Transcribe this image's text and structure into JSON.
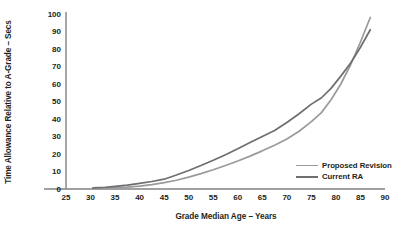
{
  "chart_data": {
    "type": "line",
    "title": "",
    "xlabel": "Grade Median Age – Years",
    "ylabel": "Time Allowance Relative to A-Grade – Secs",
    "xlim": [
      25,
      90
    ],
    "ylim": [
      0,
      100
    ],
    "xticks": [
      "25",
      "30",
      "35",
      "40",
      "45",
      "50",
      "55",
      "60",
      "65",
      "70",
      "75",
      "80",
      "85",
      "90"
    ],
    "yticks": [
      "0",
      "10",
      "20",
      "30",
      "40",
      "50",
      "60",
      "70",
      "80",
      "90",
      "100"
    ],
    "grid": false,
    "legend_position": "center-right",
    "series": [
      {
        "name": "Proposed Revision",
        "color": "#9a9a9a",
        "x": [
          30.5,
          33,
          35,
          37.5,
          40,
          42.5,
          45,
          47.5,
          50,
          52.5,
          55,
          57.5,
          60,
          62.5,
          65,
          67.5,
          70,
          72.5,
          75,
          77,
          79,
          81,
          83,
          85,
          87
        ],
        "y": [
          0.3,
          0.5,
          0.8,
          1.1,
          1.6,
          2.5,
          3.6,
          5.0,
          6.8,
          8.8,
          11.0,
          13.4,
          16.0,
          18.8,
          21.8,
          25.0,
          28.6,
          33.0,
          38.5,
          43.5,
          51.0,
          60.0,
          71.0,
          84.0,
          98.0
        ]
      },
      {
        "name": "Current RA",
        "color": "#6d6e71",
        "x": [
          30.5,
          33,
          35,
          37.5,
          40,
          42.5,
          45,
          47.5,
          50,
          52.5,
          55,
          57.5,
          60,
          62.5,
          65,
          67.5,
          70,
          72.5,
          75,
          77,
          79,
          81,
          83,
          85,
          87
        ],
        "y": [
          0.6,
          1.0,
          1.5,
          2.2,
          3.2,
          4.3,
          5.6,
          8.0,
          10.6,
          13.4,
          16.4,
          19.6,
          23.0,
          26.6,
          30.0,
          33.4,
          38.0,
          43.0,
          48.5,
          52.0,
          57.5,
          64.5,
          72.0,
          81.0,
          91.0
        ]
      }
    ]
  },
  "legend": {
    "items": [
      {
        "label": "Proposed Revision"
      },
      {
        "label": "Current RA"
      }
    ]
  },
  "axes": {
    "axis_color": "#808285"
  }
}
